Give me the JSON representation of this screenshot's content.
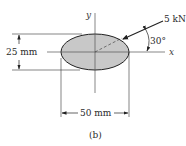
{
  "figure": {
    "caption": "(b)",
    "section": {
      "shape": "ellipse",
      "fill_color": "#c8c8c8",
      "outline_color": "#222222"
    },
    "axes": {
      "x_label": "x",
      "y_label": "y"
    },
    "dimensions": {
      "height": "25 mm",
      "width": "50 mm"
    },
    "load": {
      "magnitude": "5 kN",
      "angle": "30°"
    }
  }
}
